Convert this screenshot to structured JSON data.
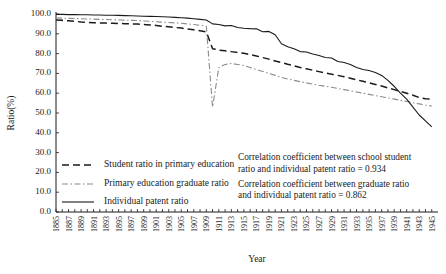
{
  "chart_data": {
    "type": "line",
    "title": "",
    "xlabel": "Year",
    "ylabel": "Ratio(%)",
    "xlim": [
      1885,
      1946
    ],
    "ylim": [
      0,
      100
    ],
    "grid": false,
    "legend_position": "inside-lower-left",
    "ytick_labels": [
      "0.0",
      "10.0",
      "20.0",
      "30.0",
      "40.0",
      "50.0",
      "60.0",
      "70.0",
      "80.0",
      "90.0",
      "100.0"
    ],
    "ytick_values": [
      0,
      10,
      20,
      30,
      40,
      50,
      60,
      70,
      80,
      90,
      100
    ],
    "xtick_labels": [
      "1885",
      "1887",
      "1889",
      "1891",
      "1893",
      "1895",
      "1897",
      "1899",
      "1901",
      "1903",
      "1905",
      "1907",
      "1909",
      "1911",
      "1913",
      "1915",
      "1917",
      "1919",
      "1921",
      "1923",
      "1925",
      "1927",
      "1929",
      "1931",
      "1933",
      "1935",
      "1937",
      "1939",
      "1941",
      "1943",
      "1945"
    ],
    "x": [
      1885,
      1886,
      1887,
      1888,
      1889,
      1890,
      1891,
      1892,
      1893,
      1894,
      1895,
      1896,
      1897,
      1898,
      1899,
      1900,
      1901,
      1902,
      1903,
      1904,
      1905,
      1906,
      1907,
      1908,
      1909,
      1910,
      1911,
      1912,
      1913,
      1914,
      1915,
      1916,
      1917,
      1918,
      1919,
      1920,
      1921,
      1922,
      1923,
      1924,
      1925,
      1926,
      1927,
      1928,
      1929,
      1930,
      1931,
      1932,
      1933,
      1934,
      1935,
      1936,
      1937,
      1938,
      1939,
      1940,
      1941,
      1942,
      1943,
      1944,
      1945
    ],
    "series": [
      {
        "name": "Student ratio in primary education",
        "style": "dashed",
        "color": "#1a1a1a",
        "values": [
          97.0,
          96.8,
          96.6,
          96.3,
          96.0,
          95.8,
          95.6,
          95.5,
          95.4,
          95.3,
          95.2,
          95.1,
          95.0,
          94.9,
          94.7,
          94.5,
          94.2,
          93.8,
          93.5,
          93.2,
          92.9,
          92.4,
          92.0,
          91.5,
          91.0,
          82.5,
          81.8,
          81.4,
          81.0,
          80.6,
          80.2,
          79.5,
          78.8,
          78.0,
          77.2,
          76.3,
          75.5,
          74.6,
          73.8,
          73.0,
          72.3,
          71.6,
          70.9,
          70.2,
          69.6,
          69.0,
          68.3,
          67.6,
          66.8,
          66.0,
          65.2,
          64.4,
          63.6,
          62.7,
          61.8,
          60.9,
          60.0,
          59.0,
          57.8,
          57.2,
          57.0
        ]
      },
      {
        "name": "Primary education graduate ratio",
        "style": "dashdot",
        "color": "#8a8a8a",
        "values": [
          98.0,
          97.9,
          97.8,
          97.7,
          97.6,
          97.5,
          97.4,
          97.3,
          97.2,
          97.1,
          97.0,
          96.9,
          96.8,
          96.7,
          96.5,
          96.3,
          96.1,
          95.9,
          95.7,
          95.5,
          95.3,
          95.0,
          94.7,
          94.3,
          93.8,
          53.0,
          73.0,
          74.5,
          75.0,
          74.5,
          74.0,
          73.0,
          72.0,
          71.0,
          70.0,
          69.0,
          68.0,
          67.2,
          66.5,
          65.8,
          65.2,
          64.6,
          64.0,
          63.5,
          63.0,
          62.4,
          61.8,
          61.2,
          60.6,
          60.0,
          59.4,
          58.8,
          58.2,
          57.6,
          57.0,
          56.4,
          55.8,
          55.2,
          54.6,
          54.0,
          53.5
        ]
      },
      {
        "name": "Individual patent ratio",
        "style": "solid",
        "color": "#1a1a1a",
        "values": [
          99.8,
          99.8,
          99.7,
          99.7,
          99.6,
          99.6,
          99.5,
          99.5,
          99.4,
          99.4,
          99.3,
          99.2,
          99.1,
          99.0,
          98.9,
          98.8,
          98.7,
          98.6,
          98.5,
          98.3,
          98.1,
          97.9,
          97.6,
          97.3,
          97.0,
          95.0,
          94.7,
          94.0,
          94.2,
          93.2,
          92.8,
          92.6,
          92.5,
          91.0,
          91.2,
          89.5,
          85.0,
          83.5,
          82.5,
          81.0,
          80.8,
          79.8,
          79.0,
          78.0,
          77.8,
          76.0,
          75.5,
          74.5,
          73.0,
          72.0,
          71.5,
          70.5,
          69.0,
          66.5,
          63.5,
          60.0,
          57.0,
          53.0,
          49.0,
          46.0,
          43.0
        ]
      }
    ],
    "annotations": [
      "Correlation coefficient between school student",
      "ratio and individual patent ratio = 0.934",
      "Correlation coefficient between graduate ratio",
      "and individual patent ratio = 0.862"
    ]
  }
}
